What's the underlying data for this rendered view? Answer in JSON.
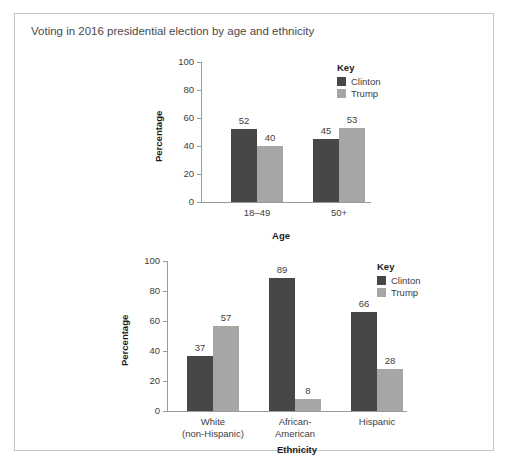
{
  "crop_header_fragment": "",
  "panel": {
    "title": "Voting in 2016 presidential election by age and ethnicity"
  },
  "legend": {
    "title": "Key",
    "items": [
      {
        "label": "Clinton",
        "color": "#474747"
      },
      {
        "label": "Trump",
        "color": "#a6a6a6"
      }
    ]
  },
  "chart_data": [
    {
      "type": "bar",
      "id": "age-chart",
      "title": "",
      "xlabel": "Age",
      "ylabel": "Percentage",
      "categories": [
        "18–49",
        "50+"
      ],
      "ylim": [
        0,
        100
      ],
      "yticks": [
        0,
        20,
        40,
        60,
        80,
        100
      ],
      "grid": false,
      "legend_position": "top-right",
      "series": [
        {
          "name": "Clinton",
          "color": "#474747",
          "values": [
            52,
            45
          ]
        },
        {
          "name": "Trump",
          "color": "#a6a6a6",
          "values": [
            40,
            53
          ]
        }
      ]
    },
    {
      "type": "bar",
      "id": "ethnicity-chart",
      "title": "",
      "xlabel": "Ethnicity",
      "ylabel": "Percentage",
      "categories": [
        "White\n(non-Hispanic)",
        "African-\nAmerican",
        "Hispanic"
      ],
      "ylim": [
        0,
        100
      ],
      "yticks": [
        0,
        20,
        40,
        60,
        80,
        100
      ],
      "grid": false,
      "legend_position": "top-right",
      "series": [
        {
          "name": "Clinton",
          "color": "#474747",
          "values": [
            37,
            89,
            66
          ]
        },
        {
          "name": "Trump",
          "color": "#a6a6a6",
          "values": [
            57,
            8,
            28
          ]
        }
      ]
    }
  ]
}
